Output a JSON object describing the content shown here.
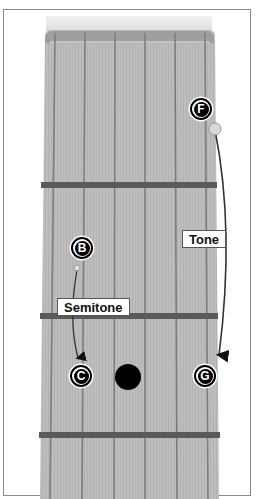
{
  "diagram": {
    "type": "guitar-fretboard-interval",
    "strings": 6,
    "frets_visible": 3,
    "notes": [
      {
        "id": "F",
        "label": "F",
        "string": 6,
        "position": "upper"
      },
      {
        "id": "B",
        "label": "B",
        "string": 1,
        "position": "middle"
      },
      {
        "id": "C",
        "label": "C",
        "string": 1,
        "position": "lower"
      },
      {
        "id": "G",
        "label": "G",
        "string": 6,
        "position": "lower"
      }
    ],
    "intervals": [
      {
        "from": "B",
        "to": "C",
        "label": "Semitone"
      },
      {
        "from": "F",
        "to": "G",
        "label": "Tone"
      }
    ],
    "inlay_marker": "fret-position-dot"
  },
  "colors": {
    "fretboard": "#b8b8b8",
    "string": "#7a7a7a",
    "fret": "#555555",
    "note_fill": "#000000",
    "note_text": "#ffffff",
    "arrow": "#222222"
  }
}
